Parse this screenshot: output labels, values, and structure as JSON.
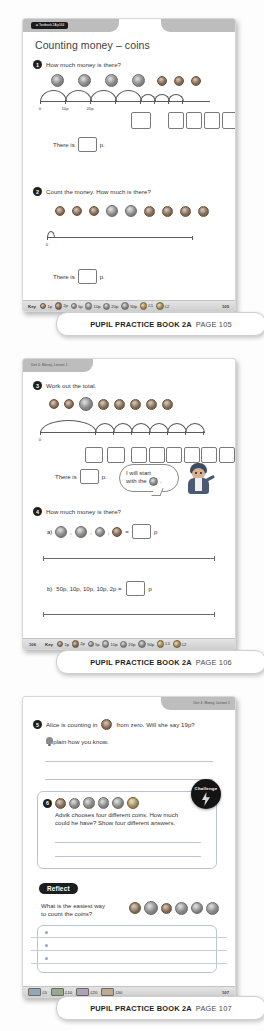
{
  "document": {
    "series": "Pupil Practice Book 2A",
    "unit_label": "Unit 4: Money, Lesson 1",
    "textbook_chip": "◄ Textbook 2A p164"
  },
  "captions": [
    {
      "bold": "PUPIL PRACTICE BOOK 2A",
      "light": "PAGE 105"
    },
    {
      "bold": "PUPIL PRACTICE BOOK 2A",
      "light": "PAGE 106"
    },
    {
      "bold": "PUPIL PRACTICE BOOK 2A",
      "light": "PAGE 107"
    }
  ],
  "page105": {
    "page_number": "105",
    "title": "Counting money – coins",
    "q1": {
      "number": "1",
      "text": "How much money is there?",
      "coins": [
        "10p",
        "10p",
        "10p",
        "10p",
        "1p",
        "1p",
        "1p"
      ],
      "tick_labels": [
        "0",
        "10p",
        "20p"
      ],
      "answer_boxes": 5,
      "answer_prompt": "There is",
      "answer_unit": "p."
    },
    "q2": {
      "number": "2",
      "text": "Count the money. How much is there?",
      "coins": [
        "1p",
        "1p",
        "1p",
        "5p",
        "5p",
        "2p",
        "2p",
        "2p",
        "2p"
      ],
      "tick_labels": [
        "0"
      ],
      "answer_prompt": "There is",
      "answer_unit": "p."
    },
    "key": {
      "label": "Key",
      "items": [
        "1p",
        "2p",
        "5p",
        "10p",
        "20p",
        "50p",
        "£1",
        "£2"
      ]
    }
  },
  "page106": {
    "page_number": "106",
    "unit_label": "Unit 4: Money, Lesson 1",
    "q3": {
      "number": "3",
      "text": "Work out the total.",
      "coins": [
        "1p",
        "1p",
        "50p",
        "2p",
        "2p",
        "2p",
        "2p",
        "2p"
      ],
      "tick_labels": [
        "0"
      ],
      "answer_boxes": 9,
      "answer_prompt": "There is",
      "answer_unit": "p.",
      "speech_line1": "I will start",
      "speech_line2": "with the",
      "speech_coin": "50p",
      "speech_end": "."
    },
    "q4": {
      "number": "4",
      "text": "How much money is there?",
      "part_a_label": "a)",
      "part_a_coins": [
        "20p",
        "20p",
        "5p",
        "2p"
      ],
      "part_a_equals": "=",
      "part_a_unit": "p",
      "part_b_label": "b)",
      "part_b_text": "50p, 10p, 10p, 10p, 2p =",
      "part_b_unit": "p"
    },
    "key": {
      "label": "Key",
      "items": [
        "1p",
        "2p",
        "5p",
        "10p",
        "20p",
        "50p",
        "£1",
        "£2"
      ]
    }
  },
  "page107": {
    "page_number": "107",
    "unit_label": "Unit 4: Money, Lesson 1",
    "q5": {
      "number": "5",
      "text_before": "Alice is counting in",
      "coin": "2p",
      "text_after": "from zero. Will she say 19p?",
      "line2": "Explain how you know.",
      "answer_lines": 2
    },
    "q6": {
      "number": "6",
      "coins": [
        "2p",
        "5p",
        "10p",
        "20p",
        "50p",
        "£1"
      ],
      "text": "Advik chooses four different coins. How much could he have? Show four different answers.",
      "answer_lines": 3,
      "badge": "Challenge"
    },
    "reflect": {
      "label": "Reflect",
      "question_line1": "What is the easiest way",
      "question_line2": "to count the coins?",
      "coins": [
        "1p",
        "2p",
        "5p",
        "10p",
        "20p",
        "50p"
      ],
      "answer_lines": 3
    },
    "key": {
      "items": [
        "£5",
        "£10",
        "£20",
        "£50"
      ]
    }
  },
  "colors": {
    "panel_header": "#bdbdbd",
    "badge_black": "#1d1d1d",
    "rule_blue": "#b9c6d2"
  }
}
